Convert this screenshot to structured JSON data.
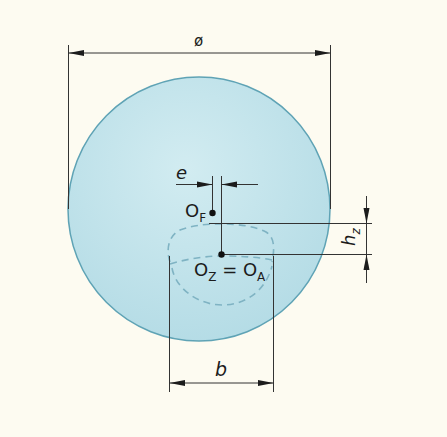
{
  "diagram": {
    "type": "technical-dimension-drawing",
    "colors": {
      "background": "#fdfbf1",
      "lens_fill": "#bfe2ea",
      "lens_outline": "#5fa3b5",
      "dashed_outline": "#7fb3c3",
      "dimension_lines": "#222222"
    },
    "labels": {
      "diameter": "ø",
      "eccentricity": "e",
      "point_F": "O",
      "point_F_sub": "F",
      "point_Z": "O",
      "point_Z_sub": "Z",
      "equals": " = ",
      "point_A": "O",
      "point_A_sub": "A",
      "height": "h",
      "height_sub": "z",
      "width": "b"
    },
    "dimensions": [
      {
        "name": "diameter",
        "symbol": "ø",
        "orientation": "horizontal"
      },
      {
        "name": "decentration",
        "symbol": "e",
        "orientation": "horizontal"
      },
      {
        "name": "segment-height-offset",
        "symbol": "h_z",
        "orientation": "vertical"
      },
      {
        "name": "segment-width",
        "symbol": "b",
        "orientation": "horizontal"
      }
    ],
    "points": [
      {
        "name": "O_F",
        "description": "far-vision optical center"
      },
      {
        "name": "O_Z = O_A",
        "description": "segment center coincides with near point"
      }
    ]
  }
}
